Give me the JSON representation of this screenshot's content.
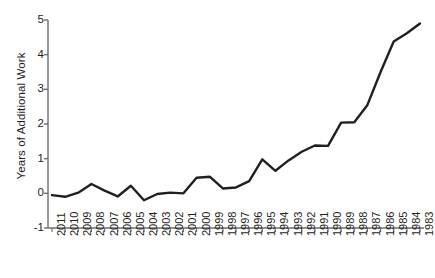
{
  "chart_data": {
    "type": "line",
    "title": "",
    "xlabel": "",
    "ylabel": "Years of Additional Work",
    "categories": [
      "2011",
      "2010",
      "2009",
      "2008",
      "2007",
      "2006",
      "2005",
      "2004",
      "2003",
      "2002",
      "2001",
      "2000",
      "1999",
      "1998",
      "1997",
      "1996",
      "1995",
      "1994",
      "1993",
      "1992",
      "1991",
      "1990",
      "1989",
      "1988",
      "1987",
      "1986",
      "1985",
      "1984",
      "1983"
    ],
    "values": [
      -0.05,
      -0.1,
      0.02,
      0.27,
      0.08,
      -0.09,
      0.22,
      -0.2,
      -0.02,
      0.02,
      0.0,
      0.45,
      0.48,
      0.14,
      0.17,
      0.35,
      0.98,
      0.65,
      0.95,
      1.2,
      1.38,
      1.37,
      2.04,
      2.05,
      2.55,
      3.5,
      4.38,
      4.62,
      4.9
    ],
    "ylim": [
      -1,
      5
    ],
    "yticks": [
      -1,
      0,
      1,
      2,
      3,
      4,
      5
    ],
    "ytick_labels": [
      "-1",
      "0",
      "1",
      "2",
      "3",
      "4",
      "5"
    ],
    "grid": false,
    "legend": false,
    "legend_position": "none",
    "series": [
      {
        "name": "Years of Additional Work",
        "color": "#231f20",
        "values": [
          -0.05,
          -0.1,
          0.02,
          0.27,
          0.08,
          -0.09,
          0.22,
          -0.2,
          -0.02,
          0.02,
          0.0,
          0.45,
          0.48,
          0.14,
          0.17,
          0.35,
          0.98,
          0.65,
          0.95,
          1.2,
          1.38,
          1.37,
          2.04,
          2.05,
          2.55,
          3.5,
          4.38,
          4.62,
          4.9
        ]
      }
    ],
    "axis_color": "#6d6e71",
    "line_color": "#231f20",
    "line_width": 2.4,
    "background": "#ffffff"
  }
}
